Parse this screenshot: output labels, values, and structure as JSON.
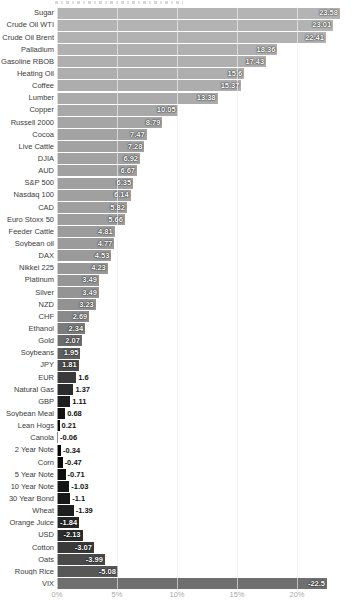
{
  "chart_data": {
    "type": "bar",
    "orientation": "horizontal",
    "title": "",
    "xlabel": "",
    "ylabel": "",
    "unit": "%",
    "xlim": [
      0,
      25.5
    ],
    "grid": true,
    "x_ticks": [
      {
        "label": "0%",
        "value": 0
      },
      {
        "label": "5%",
        "value": 5
      },
      {
        "label": "10%",
        "value": 10
      },
      {
        "label": "15%",
        "value": 15
      },
      {
        "label": "20%",
        "value": 20
      }
    ],
    "note": "negative values drawn as bars of absolute length in darker shades",
    "rows": [
      {
        "label": "Sugar",
        "value": 23.58,
        "display": "23.58",
        "color": "#b4b4b4"
      },
      {
        "label": "Crude Oil WTI",
        "value": 23.01,
        "display": "23.01",
        "color": "#b3b3b3"
      },
      {
        "label": "Crude Oil Brent",
        "value": 22.41,
        "display": "22.41",
        "color": "#b2b2b2"
      },
      {
        "label": "Palladium",
        "value": 18.36,
        "display": "18.36",
        "color": "#b0b0b0"
      },
      {
        "label": "Gasoline RBOB",
        "value": 17.43,
        "display": "17.43",
        "color": "#afafaf"
      },
      {
        "label": "Heating Oil",
        "value": 15.6,
        "display": "15.6",
        "color": "#aeaeae"
      },
      {
        "label": "Coffee",
        "value": 15.37,
        "display": "15.37",
        "color": "#adadad"
      },
      {
        "label": "Lumber",
        "value": 13.38,
        "display": "13.38",
        "color": "#ababab"
      },
      {
        "label": "Copper",
        "value": 10.05,
        "display": "10.05",
        "color": "#a8a8a8"
      },
      {
        "label": "Russell 2000",
        "value": 8.79,
        "display": "8.79",
        "color": "#a5a5a5"
      },
      {
        "label": "Cocoa",
        "value": 7.47,
        "display": "7.47",
        "color": "#a3a3a3"
      },
      {
        "label": "Live Cattle",
        "value": 7.28,
        "display": "7.28",
        "color": "#a2a2a2"
      },
      {
        "label": "DJIA",
        "value": 6.92,
        "display": "6.92",
        "color": "#a2a2a2"
      },
      {
        "label": "AUD",
        "value": 6.67,
        "display": "6.67",
        "color": "#a1a1a1"
      },
      {
        "label": "S&P 500",
        "value": 6.35,
        "display": "6.35",
        "color": "#a0a0a0"
      },
      {
        "label": "Nasdaq 100",
        "value": 6.14,
        "display": "6.14",
        "color": "#a0a0a0"
      },
      {
        "label": "CAD",
        "value": 5.82,
        "display": "5.82",
        "color": "#9f9f9f"
      },
      {
        "label": "Euro Stoxx 50",
        "value": 5.66,
        "display": "5.66",
        "color": "#9e9e9e"
      },
      {
        "label": "Feeder Cattle",
        "value": 4.81,
        "display": "4.81",
        "color": "#9c9c9c"
      },
      {
        "label": "Soybean oil",
        "value": 4.77,
        "display": "4.77",
        "color": "#9b9b9b"
      },
      {
        "label": "DAX",
        "value": 4.53,
        "display": "4.53",
        "color": "#9a9a9a"
      },
      {
        "label": "Nikkei 225",
        "value": 4.23,
        "display": "4.23",
        "color": "#989898"
      },
      {
        "label": "Platinum",
        "value": 3.49,
        "display": "3.49",
        "color": "#959595"
      },
      {
        "label": "Silver",
        "value": 3.49,
        "display": "3.49",
        "color": "#949494"
      },
      {
        "label": "NZD",
        "value": 3.23,
        "display": "3.23",
        "color": "#929292"
      },
      {
        "label": "CHF",
        "value": 2.69,
        "display": "2.69",
        "color": "#8a8a8a"
      },
      {
        "label": "Ethanol",
        "value": 2.34,
        "display": "2.34",
        "color": "#7b7b7b"
      },
      {
        "label": "Gold",
        "value": 2.07,
        "display": "2.07",
        "color": "#6c6c6c"
      },
      {
        "label": "Soybeans",
        "value": 1.95,
        "display": "1.95",
        "color": "#5e5e5e"
      },
      {
        "label": "JPY",
        "value": 1.81,
        "display": "1.81",
        "color": "#4c4c4c"
      },
      {
        "label": "EUR",
        "value": 1.6,
        "display": "1.6",
        "color": "#3a3a3a"
      },
      {
        "label": "Natural Gas",
        "value": 1.37,
        "display": "1.37",
        "color": "#2b2b2b"
      },
      {
        "label": "GBP",
        "value": 1.11,
        "display": "1.11",
        "color": "#1e1e1e"
      },
      {
        "label": "Soybean Meal",
        "value": 0.68,
        "display": "0.68",
        "color": "#121212"
      },
      {
        "label": "Lean Hogs",
        "value": 0.21,
        "display": "0.21",
        "color": "#060606"
      },
      {
        "label": "Canola",
        "value": -0.06,
        "display": "-0.06",
        "color": "#000000"
      },
      {
        "label": "2 Year Note",
        "value": -0.34,
        "display": "-0.34",
        "color": "#000000"
      },
      {
        "label": "Corn",
        "value": -0.47,
        "display": "-0.47",
        "color": "#070707"
      },
      {
        "label": "5 Year Note",
        "value": -0.71,
        "display": "-0.71",
        "color": "#0f0f0f"
      },
      {
        "label": "10 Year Note",
        "value": -1.03,
        "display": "-1.03",
        "color": "#151515"
      },
      {
        "label": "30 Year Bond",
        "value": -1.1,
        "display": "-1.1",
        "color": "#171717"
      },
      {
        "label": "Wheat",
        "value": -1.39,
        "display": "-1.39",
        "color": "#1e1e1e"
      },
      {
        "label": "Orange Juice",
        "value": -1.84,
        "display": "-1.84",
        "color": "#262626"
      },
      {
        "label": "USD",
        "value": -2.13,
        "display": "-2.13",
        "color": "#2c2c2c"
      },
      {
        "label": "Cotton",
        "value": -3.07,
        "display": "-3.07",
        "color": "#3a3a3a"
      },
      {
        "label": "Oats",
        "value": -3.99,
        "display": "-3.99",
        "color": "#4a4a4a"
      },
      {
        "label": "Rough Rice",
        "value": -5.08,
        "display": "-5.08",
        "color": "#575757"
      },
      {
        "label": "VIX",
        "value": -22.5,
        "display": "-22.5",
        "color": "#6f6f6f"
      }
    ]
  }
}
